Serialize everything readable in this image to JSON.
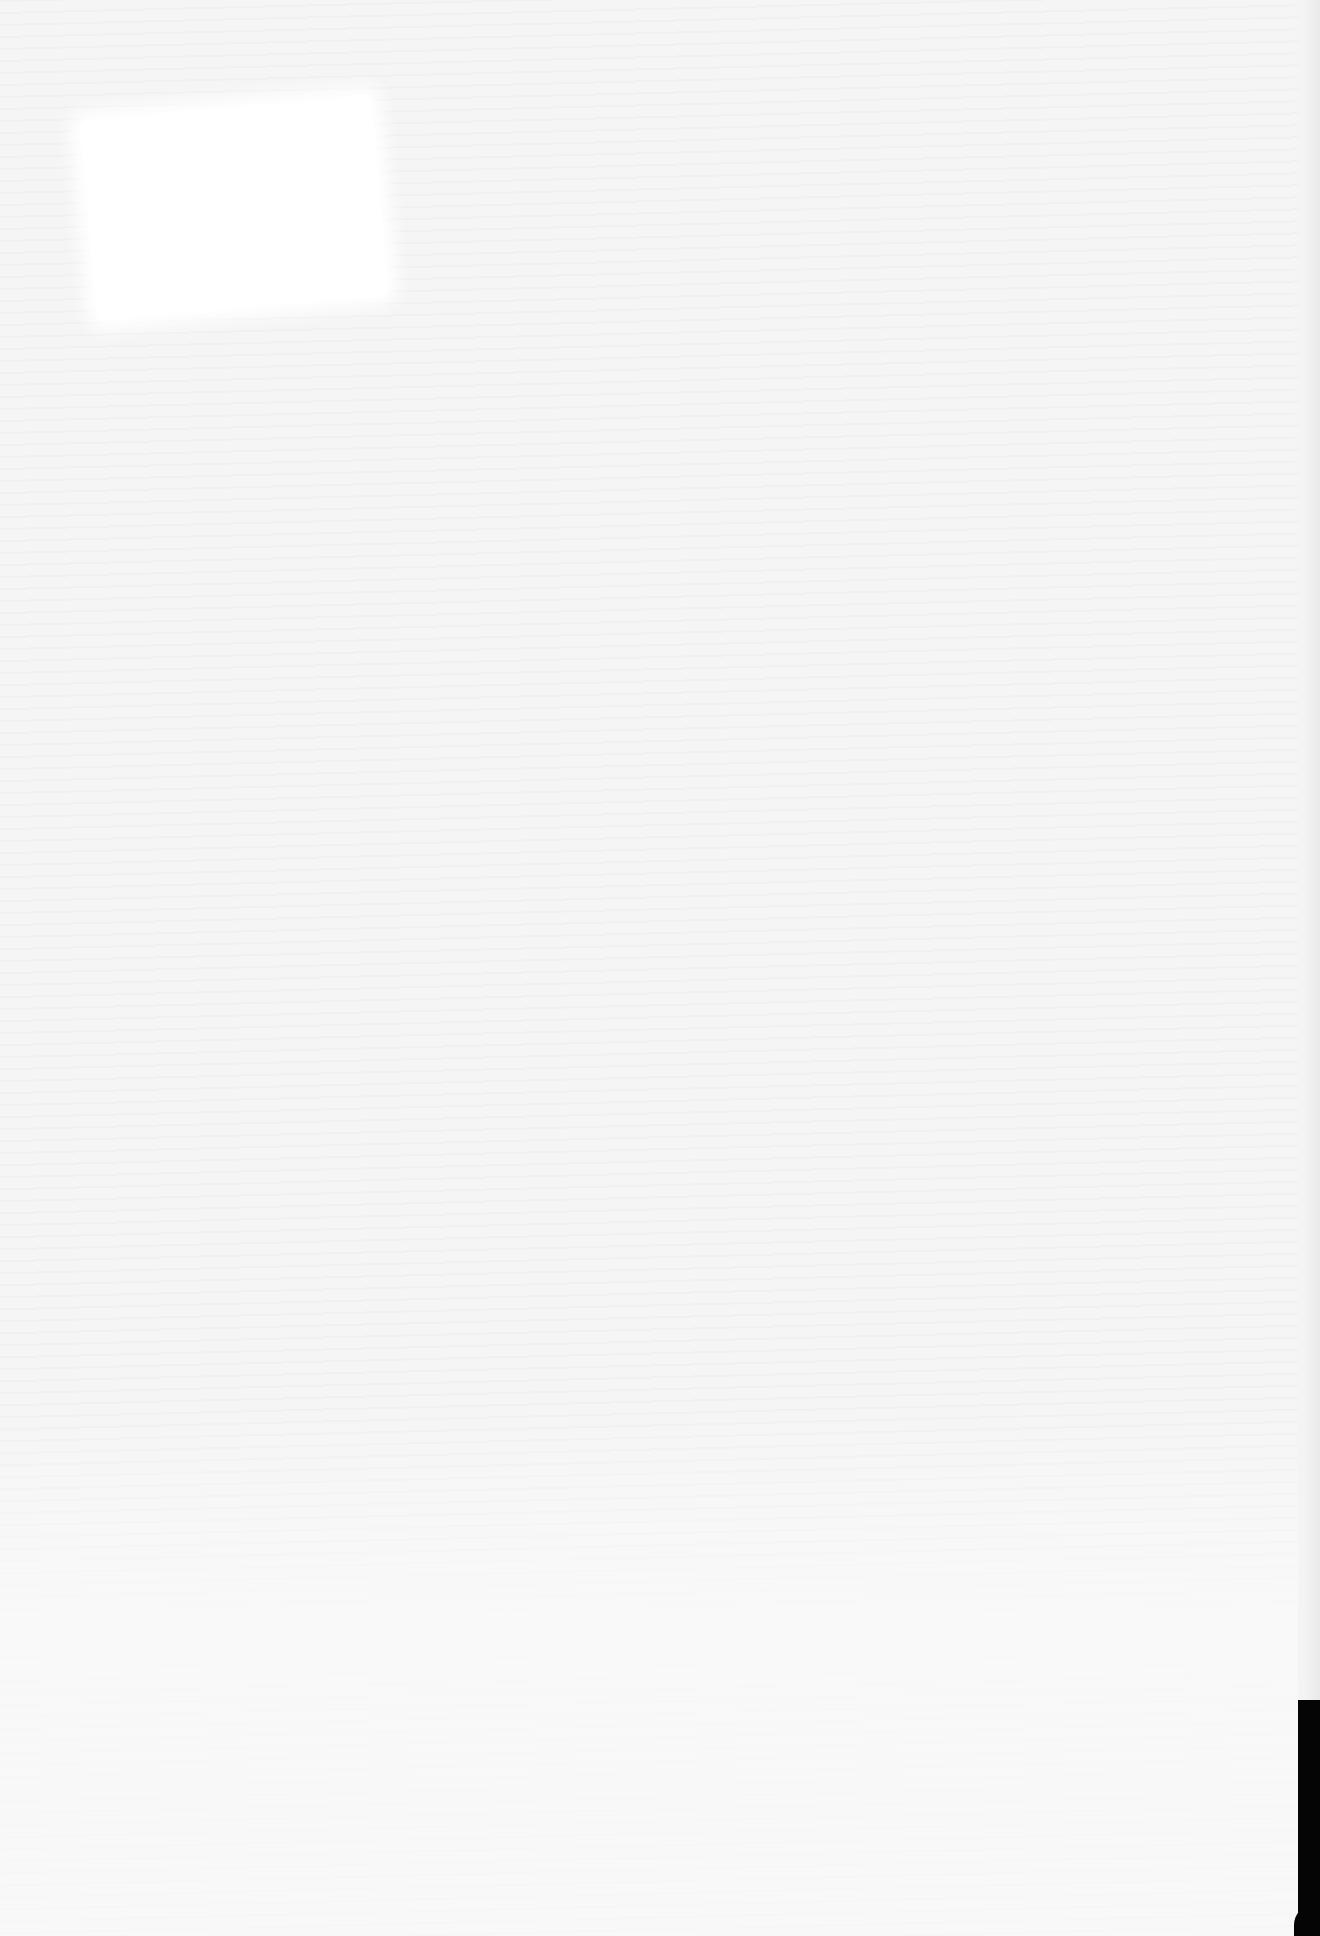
{
  "document": {
    "type": "scanned-page",
    "state": "blank",
    "visible_text": "",
    "features": {
      "bleed_through": "faint illegible mirrored text from reverse side",
      "blank_patch": "whiter rectangular region near top-left",
      "scanner_edge": "dark border along right edge near bottom"
    }
  },
  "colors": {
    "paper": "#f5f5f5",
    "patch": "#ffffff",
    "edge": "#050505"
  }
}
